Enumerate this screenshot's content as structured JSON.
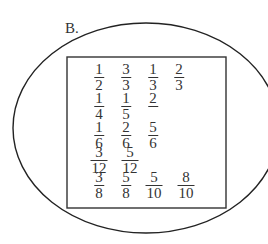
{
  "label": "B.",
  "shapes": {
    "ellipse": {
      "cx": 146,
      "cy": 128,
      "rx": 133,
      "ry": 105,
      "stroke": "#222222"
    },
    "rectangle": {
      "x": 67,
      "y": 57,
      "width": 159,
      "height": 151,
      "stroke": "#333333"
    }
  },
  "rows": [
    {
      "y": 6,
      "items": [
        {
          "x": 26,
          "num": "1",
          "den": "2"
        },
        {
          "x": 53,
          "num": "3",
          "den": "3"
        },
        {
          "x": 80,
          "num": "1",
          "den": "3"
        },
        {
          "x": 106,
          "num": "2",
          "den": "3"
        }
      ]
    },
    {
      "y": 35,
      "items": [
        {
          "x": 26,
          "num": "1",
          "den": "4"
        },
        {
          "x": 53,
          "num": "1",
          "den": "5"
        },
        {
          "x": 80,
          "num": "2",
          "den": ""
        }
      ]
    },
    {
      "y": 64,
      "items": [
        {
          "x": 26,
          "num": "1",
          "den": "6"
        },
        {
          "x": 53,
          "num": "2",
          "den": "6"
        },
        {
          "x": 80,
          "num": "5",
          "den": "6"
        }
      ]
    },
    {
      "y": 89,
      "items": [
        {
          "x": 26,
          "num": "3",
          "den": "12"
        },
        {
          "x": 57,
          "num": "5",
          "den": "12"
        }
      ]
    },
    {
      "y": 114,
      "items": [
        {
          "x": 26,
          "num": "3",
          "den": "8"
        },
        {
          "x": 53,
          "num": "5",
          "den": "8"
        },
        {
          "x": 81,
          "num": "5",
          "den": "10"
        },
        {
          "x": 113,
          "num": "8",
          "den": "10"
        }
      ]
    }
  ]
}
